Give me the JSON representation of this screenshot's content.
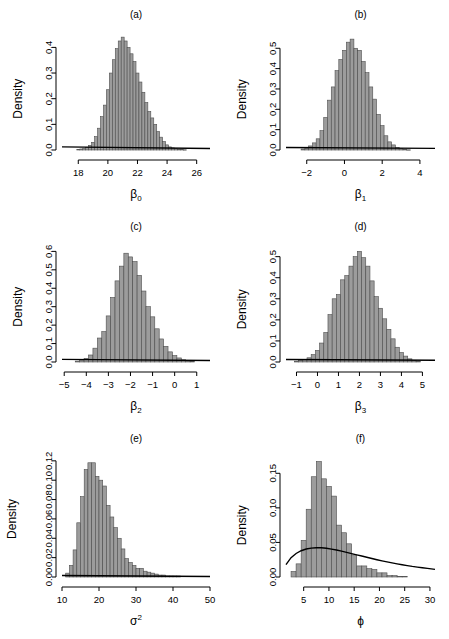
{
  "figure": {
    "name": "posterior-density-histograms",
    "panel_count": 6,
    "layout": "3 rows x 2 columns",
    "bar_color": "#9c9c9c",
    "bar_border_color": "#4d4d4d",
    "curve_color": "#000000",
    "background": "#ffffff"
  },
  "chart_data": [
    {
      "id": "a",
      "type": "bar",
      "title": "(a)",
      "xlabel": "β₀",
      "xlabel_base": "β",
      "xlabel_sub": "0",
      "ylabel": "Density",
      "xlim": [
        16.9,
        26.9
      ],
      "ylim": [
        0,
        0.46
      ],
      "xticks": [
        18,
        20,
        22,
        24,
        26
      ],
      "xtick_labels": [
        "18",
        "20",
        "22",
        "24",
        "26"
      ],
      "yticks": [
        0.0,
        0.1,
        0.2,
        0.3,
        0.4
      ],
      "ytick_labels": [
        "0.0",
        "0.1",
        "0.2",
        "0.3",
        "0.4"
      ],
      "grid": false,
      "legend": "none",
      "bin_width": 0.2,
      "bin_starts": [
        16.9,
        17.1,
        17.3,
        17.5,
        17.7,
        17.9,
        18.1,
        18.3,
        18.5,
        18.7,
        18.9,
        19.1,
        19.3,
        19.5,
        19.7,
        19.9,
        20.1,
        20.3,
        20.5,
        20.7,
        20.9,
        21.1,
        21.3,
        21.5,
        21.7,
        21.9,
        22.1,
        22.3,
        22.5,
        22.7,
        22.9,
        23.1,
        23.3,
        23.5,
        23.7,
        23.9,
        24.1,
        24.3,
        24.5,
        24.7,
        24.9,
        25.1,
        25.3,
        25.5,
        25.7,
        25.9,
        26.1,
        26.3,
        26.5,
        26.7
      ],
      "values": [
        0.0,
        0.0,
        0.0,
        0.0,
        0.0,
        0.002,
        0.004,
        0.006,
        0.01,
        0.018,
        0.03,
        0.052,
        0.085,
        0.13,
        0.175,
        0.235,
        0.3,
        0.352,
        0.395,
        0.425,
        0.44,
        0.425,
        0.4,
        0.375,
        0.345,
        0.3,
        0.265,
        0.225,
        0.185,
        0.15,
        0.125,
        0.1,
        0.072,
        0.05,
        0.033,
        0.02,
        0.012,
        0.008,
        0.005,
        0.003,
        0.002,
        0.001,
        0.0,
        0.0,
        0.0,
        0.0,
        0.0,
        0.0,
        0.0,
        0.0
      ],
      "prior_curve": {
        "description": "flat prior, nearly horizontal near zero density",
        "x": [
          16.9,
          26.9
        ],
        "y": [
          0.012,
          0.006
        ]
      }
    },
    {
      "id": "b",
      "type": "bar",
      "title": "(b)",
      "xlabel": "β₁",
      "xlabel_base": "β",
      "xlabel_sub": "1",
      "ylabel": "Density",
      "xlim": [
        -3.1,
        4.8
      ],
      "ylim": [
        0,
        0.58
      ],
      "xticks": [
        -2,
        0,
        2,
        4
      ],
      "xtick_labels": [
        "−2",
        "0",
        "2",
        "4"
      ],
      "yticks": [
        0.0,
        0.1,
        0.2,
        0.3,
        0.4,
        0.5
      ],
      "ytick_labels": [
        "0.0",
        "0.1",
        "0.2",
        "0.3",
        "0.4",
        "0.5"
      ],
      "grid": false,
      "legend": "none",
      "bin_width": 0.2,
      "bin_starts": [
        -3.1,
        -2.9,
        -2.7,
        -2.5,
        -2.3,
        -2.1,
        -1.9,
        -1.7,
        -1.5,
        -1.3,
        -1.1,
        -0.9,
        -0.7,
        -0.5,
        -0.3,
        -0.1,
        0.1,
        0.3,
        0.5,
        0.7,
        0.9,
        1.1,
        1.3,
        1.5,
        1.7,
        1.9,
        2.1,
        2.3,
        2.5,
        2.7,
        2.9,
        3.1,
        3.3,
        3.5,
        3.7,
        3.9,
        4.1,
        4.3,
        4.5
      ],
      "values": [
        0.0,
        0.0,
        0.0,
        0.0,
        0.005,
        0.01,
        0.02,
        0.035,
        0.055,
        0.095,
        0.16,
        0.245,
        0.31,
        0.39,
        0.445,
        0.49,
        0.53,
        0.545,
        0.5,
        0.49,
        0.435,
        0.38,
        0.31,
        0.25,
        0.175,
        0.12,
        0.07,
        0.04,
        0.025,
        0.013,
        0.006,
        0.003,
        0.001,
        0.0,
        0.0,
        0.0,
        0.0,
        0.0,
        0.0
      ],
      "prior_curve": {
        "description": "flat prior, nearly horizontal near zero density",
        "x": [
          -3.1,
          4.8
        ],
        "y": [
          0.012,
          0.008
        ]
      }
    },
    {
      "id": "c",
      "type": "bar",
      "title": "(c)",
      "xlabel": "β₂",
      "xlabel_base": "β",
      "xlabel_sub": "2",
      "ylabel": "Density",
      "xlim": [
        -5.1,
        1.6
      ],
      "ylim": [
        0,
        0.64
      ],
      "xticks": [
        -5,
        -4,
        -3,
        -2,
        -1,
        0,
        1
      ],
      "xtick_labels": [
        "−5",
        "−4",
        "−3",
        "−2",
        "−1",
        "0",
        "1"
      ],
      "yticks": [
        0.0,
        0.1,
        0.2,
        0.3,
        0.4,
        0.5,
        0.6
      ],
      "ytick_labels": [
        "0.0",
        "0.1",
        "0.2",
        "0.3",
        "0.4",
        "0.5",
        "0.6"
      ],
      "grid": false,
      "legend": "none",
      "bin_width": 0.2,
      "bin_starts": [
        -5.1,
        -4.9,
        -4.7,
        -4.5,
        -4.3,
        -4.1,
        -3.9,
        -3.7,
        -3.5,
        -3.3,
        -3.1,
        -2.9,
        -2.7,
        -2.5,
        -2.3,
        -2.1,
        -1.9,
        -1.7,
        -1.5,
        -1.3,
        -1.1,
        -0.9,
        -0.7,
        -0.5,
        -0.3,
        -0.1,
        0.1,
        0.3,
        0.5,
        0.7,
        0.9,
        1.1,
        1.3
      ],
      "values": [
        0.0,
        0.0,
        0.0,
        0.005,
        0.01,
        0.02,
        0.038,
        0.075,
        0.13,
        0.165,
        0.25,
        0.35,
        0.44,
        0.52,
        0.59,
        0.57,
        0.545,
        0.47,
        0.385,
        0.3,
        0.245,
        0.18,
        0.125,
        0.085,
        0.055,
        0.035,
        0.022,
        0.012,
        0.006,
        0.003,
        0.0,
        0.0,
        0.0
      ],
      "prior_curve": {
        "description": "flat prior, nearly horizontal near zero density",
        "x": [
          -5.1,
          1.6
        ],
        "y": [
          0.014,
          0.008
        ]
      }
    },
    {
      "id": "d",
      "type": "bar",
      "title": "(d)",
      "xlabel": "β₃",
      "xlabel_base": "β",
      "xlabel_sub": "3",
      "ylabel": "Density",
      "xlim": [
        -1.5,
        5.6
      ],
      "ylim": [
        0,
        0.56
      ],
      "xticks": [
        -1,
        0,
        1,
        2,
        3,
        4,
        5
      ],
      "xtick_labels": [
        "−1",
        "0",
        "1",
        "2",
        "3",
        "4",
        "5"
      ],
      "yticks": [
        0.0,
        0.1,
        0.2,
        0.3,
        0.4,
        0.5
      ],
      "ytick_labels": [
        "0.0",
        "0.1",
        "0.2",
        "0.3",
        "0.4",
        "0.5"
      ],
      "grid": false,
      "legend": "none",
      "bin_width": 0.2,
      "bin_starts": [
        -1.5,
        -1.3,
        -1.1,
        -0.9,
        -0.7,
        -0.5,
        -0.3,
        -0.1,
        0.1,
        0.3,
        0.5,
        0.7,
        0.9,
        1.1,
        1.3,
        1.5,
        1.7,
        1.9,
        2.1,
        2.3,
        2.5,
        2.7,
        2.9,
        3.1,
        3.3,
        3.5,
        3.7,
        3.9,
        4.1,
        4.3,
        4.5,
        4.7,
        4.9,
        5.1,
        5.3
      ],
      "values": [
        0.0,
        0.0,
        0.004,
        0.008,
        0.012,
        0.02,
        0.035,
        0.055,
        0.09,
        0.14,
        0.225,
        0.3,
        0.32,
        0.39,
        0.41,
        0.455,
        0.5,
        0.525,
        0.495,
        0.455,
        0.385,
        0.31,
        0.255,
        0.205,
        0.155,
        0.11,
        0.07,
        0.045,
        0.028,
        0.015,
        0.008,
        0.004,
        0.0,
        0.0,
        0.0
      ],
      "prior_curve": {
        "description": "flat prior, nearly horizontal near zero density",
        "x": [
          -1.5,
          5.6
        ],
        "y": [
          0.012,
          0.008
        ]
      }
    },
    {
      "id": "e",
      "type": "bar",
      "title": "(e)",
      "xlabel": "σ²",
      "xlabel_base": "σ",
      "xlabel_sup": "2",
      "ylabel": "Density",
      "xlim": [
        10,
        50
      ],
      "ylim": [
        0,
        0.125
      ],
      "xticks": [
        10,
        20,
        30,
        40,
        50
      ],
      "xtick_labels": [
        "10",
        "20",
        "30",
        "40",
        "50"
      ],
      "yticks": [
        0.0,
        0.02,
        0.04,
        0.06,
        0.08,
        0.1,
        0.12
      ],
      "ytick_labels": [
        "0.00",
        "0.02",
        "0.04",
        "0.06",
        "0.08",
        "0.10",
        "0.12"
      ],
      "grid": false,
      "legend": "none",
      "bin_width": 1,
      "bin_starts": [
        10,
        11,
        12,
        13,
        14,
        15,
        16,
        17,
        18,
        19,
        20,
        21,
        22,
        23,
        24,
        25,
        26,
        27,
        28,
        29,
        30,
        31,
        32,
        33,
        34,
        35,
        36,
        37,
        38,
        39,
        40,
        41,
        42,
        43,
        44,
        45,
        46,
        47,
        48,
        49
      ],
      "values": [
        0.0,
        0.004,
        0.012,
        0.028,
        0.056,
        0.083,
        0.111,
        0.118,
        0.118,
        0.104,
        0.1,
        0.094,
        0.074,
        0.062,
        0.051,
        0.04,
        0.029,
        0.019,
        0.015,
        0.012,
        0.009,
        0.009,
        0.006,
        0.005,
        0.004,
        0.003,
        0.002,
        0.002,
        0.001,
        0.001,
        0.001,
        0.001,
        0.0,
        0.0,
        0.0,
        0.0,
        0.0,
        0.0,
        0.0,
        0.0
      ],
      "prior_curve": {
        "description": "flat prior lying essentially on the zero line",
        "x": [
          10,
          50
        ],
        "y": [
          0.0015,
          0.0005
        ]
      }
    },
    {
      "id": "f",
      "type": "bar",
      "title": "(f)",
      "xlabel": "ϕ",
      "xlabel_base": "ϕ",
      "ylabel": "Density",
      "xlim": [
        1.5,
        31
      ],
      "ylim": [
        0,
        0.175
      ],
      "xticks": [
        5,
        10,
        15,
        20,
        25,
        30
      ],
      "xtick_labels": [
        "5",
        "10",
        "15",
        "20",
        "25",
        "30"
      ],
      "yticks": [
        0.0,
        0.05,
        0.1,
        0.15
      ],
      "ytick_labels": [
        "0.00",
        "0.05",
        "0.10",
        "0.15"
      ],
      "grid": false,
      "legend": "none",
      "bin_width": 1,
      "bin_starts": [
        1.5,
        2.5,
        3.5,
        4.5,
        5.5,
        6.5,
        7.5,
        8.5,
        9.5,
        10.5,
        11.5,
        12.5,
        13.5,
        14.5,
        15.5,
        16.5,
        17.5,
        18.5,
        19.5,
        20.5,
        21.5,
        22.5,
        23.5,
        24.5,
        25.5,
        26.5,
        27.5,
        28.5,
        29.5
      ],
      "values": [
        0.0,
        0.008,
        0.019,
        0.053,
        0.098,
        0.145,
        0.167,
        0.142,
        0.131,
        0.117,
        0.075,
        0.064,
        0.048,
        0.032,
        0.016,
        0.016,
        0.012,
        0.011,
        0.006,
        0.006,
        0.002,
        0.002,
        0.001,
        0.001,
        0.0,
        0.0,
        0.0,
        0.0,
        0.0
      ],
      "prior_curve": {
        "description": "broad unimodal prior density peaking near phi = 8 at about 0.042",
        "x": [
          1.5,
          2.5,
          3.5,
          4.5,
          5.5,
          6.5,
          7.5,
          8.5,
          9.5,
          10.5,
          11.5,
          12.5,
          13.5,
          14.5,
          15.5,
          16.5,
          17.5,
          18.5,
          19.5,
          20.5,
          21.5,
          22.5,
          23.5,
          24.5,
          25.5,
          26.5,
          27.5,
          28.5,
          29.5,
          31
        ],
        "y": [
          0.018,
          0.028,
          0.034,
          0.038,
          0.0405,
          0.0418,
          0.0423,
          0.0422,
          0.0415,
          0.0404,
          0.039,
          0.0374,
          0.0357,
          0.0339,
          0.0321,
          0.0303,
          0.0285,
          0.0267,
          0.025,
          0.0234,
          0.0219,
          0.0204,
          0.019,
          0.0177,
          0.0165,
          0.0153,
          0.0143,
          0.0133,
          0.0124,
          0.011
        ]
      }
    }
  ]
}
